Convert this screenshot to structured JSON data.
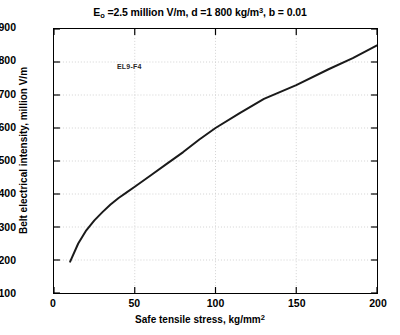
{
  "chart_data": {
    "type": "line",
    "title_parts": {
      "e_symbol": "E",
      "e_subscript": "o",
      "after_e": " =2.5 million V/m, d =1 800 kg/m",
      "density_superscript": "3",
      "tail": ", b = 0.01"
    },
    "annotation": "EL9-F4",
    "xlabel": "Safe tensile stress, kg/mm",
    "xlabel_superscript": "2",
    "ylabel": "Belt electrical intensity, million V/m",
    "xlim": [
      0,
      200
    ],
    "ylim": [
      100,
      900
    ],
    "xticks": [
      0,
      50,
      100,
      150,
      200
    ],
    "xtick_labels": [
      "0",
      "50",
      "100",
      "150",
      "200"
    ],
    "yticks": [
      100,
      200,
      300,
      400,
      500,
      600,
      700,
      800,
      900
    ],
    "ytick_labels": [
      "100",
      "200",
      "300",
      "400",
      "500",
      "600",
      "700",
      "800",
      "900"
    ],
    "grid": true,
    "grid_style": "dotted",
    "grid_color": "#c8c8c8",
    "legend": "none",
    "line_color": "#1a1a1a",
    "line_width": 2,
    "series": [
      {
        "name": "Belt electrical intensity",
        "x": [
          10,
          15,
          20,
          25,
          30,
          35,
          40,
          45,
          50,
          60,
          70,
          80,
          90,
          100,
          115,
          130,
          150,
          170,
          185,
          200
        ],
        "y": [
          195,
          250,
          290,
          320,
          345,
          368,
          388,
          405,
          422,
          457,
          492,
          527,
          565,
          600,
          645,
          688,
          730,
          778,
          812,
          850
        ]
      }
    ]
  }
}
